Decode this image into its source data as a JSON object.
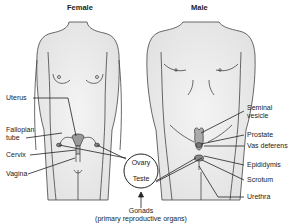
{
  "figure": {
    "female_title": "Female",
    "male_title": "Male",
    "female_labels": [
      {
        "id": "uterus",
        "text": "Uterus"
      },
      {
        "id": "fallopian-tube",
        "text": "Fallopian\ntube",
        "line1": "Fallopian",
        "line2": "tube"
      },
      {
        "id": "cervix",
        "text": "Cervix"
      },
      {
        "id": "vagina",
        "text": "Vagina"
      }
    ],
    "male_labels": [
      {
        "id": "seminal-vesicle",
        "line1": "Seminal",
        "line2": "vesicle"
      },
      {
        "id": "prostate",
        "text": "Prostate"
      },
      {
        "id": "vas-deferens",
        "text": "Vas deferens"
      },
      {
        "id": "epididymis",
        "text": "Epididymis"
      },
      {
        "id": "scrotum",
        "text": "Scrotum"
      },
      {
        "id": "urethra",
        "text": "Urethra"
      }
    ],
    "gonads_circle": {
      "ovary": "Ovary",
      "teste": "Teste"
    },
    "caption": {
      "line1": "Gonads",
      "line2": "(primary reproductive organs)"
    },
    "colors": {
      "body_fill": "#ededed",
      "outline": "#444444",
      "organ_fill": "#9a9a9a",
      "leader_line": "#222222"
    }
  }
}
